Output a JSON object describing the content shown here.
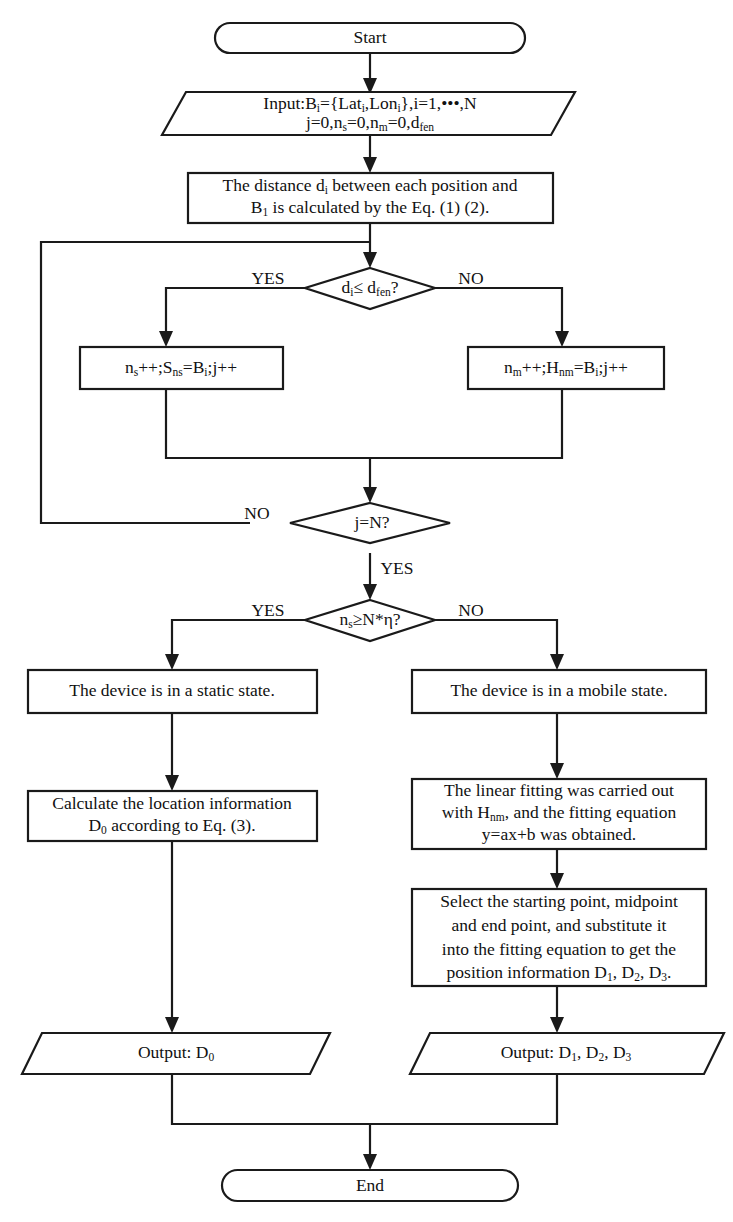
{
  "diagram": {
    "stroke_color": "#1a1a1a",
    "fill_color": "#ffffff",
    "text_color": "#111111"
  },
  "nodes": {
    "start": {
      "label": "Start",
      "shape": "terminator"
    },
    "input": {
      "shape": "parallelogram",
      "line1_a": "Input:B",
      "line1_sub1": "i",
      "line1_b": "={Lat",
      "line1_sub2": "i",
      "line1_c": ",Lon",
      "line1_sub3": "i",
      "line1_d": "},i=1,•••,N",
      "line2_a": "j=0,n",
      "line2_sub1": "s",
      "line2_b": "=0,n",
      "line2_sub2": "m",
      "line2_c": "=0,d",
      "line2_sub3": "fen"
    },
    "distance": {
      "shape": "process",
      "line1_a": "The distance d",
      "line1_sub": "i",
      "line1_b": " between each position and",
      "line2_a": "B",
      "line2_sub": "1",
      "line2_b": " is calculated by the Eq. (1) (2)."
    },
    "decision_fence": {
      "shape": "decision",
      "text_a": "d",
      "text_sub1": "i",
      "text_b": "≤ d",
      "text_sub2": "fen",
      "text_c": "?",
      "yes_label": "YES",
      "no_label": "NO"
    },
    "static_count": {
      "shape": "process",
      "text_a": "n",
      "text_sub1": "s",
      "text_b": "++;S",
      "text_sub2": "ns",
      "text_c": "=B",
      "text_sub3": "i",
      "text_d": ";j++"
    },
    "mobile_count": {
      "shape": "process",
      "text_a": "n",
      "text_sub1": "m",
      "text_b": "++;H",
      "text_sub2": "nm",
      "text_c": "=B",
      "text_sub3": "i",
      "text_d": ";j++"
    },
    "decision_jn": {
      "shape": "decision",
      "text": "j=N?",
      "no_label": "NO",
      "yes_label": "YES"
    },
    "decision_eta": {
      "shape": "decision",
      "text_a": "n",
      "text_sub1": "s",
      "text_b": "≥N*η?",
      "yes_label": "YES",
      "no_label": "NO"
    },
    "static_state": {
      "shape": "process",
      "text": "The device is in a static state."
    },
    "mobile_state": {
      "shape": "process",
      "text": "The device is in a mobile state."
    },
    "calc_location": {
      "shape": "process",
      "line1": "Calculate the location information",
      "line2_a": "D",
      "line2_sub": "0",
      "line2_b": " according to Eq. (3)."
    },
    "linear_fitting": {
      "shape": "process",
      "line1": "The linear fitting was carried out",
      "line2_a": "with H",
      "line2_sub": "nm",
      "line2_b": ", and the fitting equation",
      "line3": "y=ax+b was obtained."
    },
    "select_points": {
      "shape": "process",
      "line1": "Select the starting point, midpoint",
      "line2": "and end point, and substitute it",
      "line3": "into the fitting equation to get the",
      "line4_a": "position information D",
      "line4_sub1": "1",
      "line4_b": ", D",
      "line4_sub2": "2",
      "line4_c": ", D",
      "line4_sub3": "3",
      "line4_d": "."
    },
    "output_static": {
      "shape": "parallelogram",
      "text_a": "Output: D",
      "text_sub": "0"
    },
    "output_mobile": {
      "shape": "parallelogram",
      "text_a": "Output: D",
      "text_sub1": "1",
      "text_b": ", D",
      "text_sub2": "2",
      "text_c": ", D",
      "text_sub3": "3"
    },
    "end": {
      "label": "End",
      "shape": "terminator"
    }
  }
}
